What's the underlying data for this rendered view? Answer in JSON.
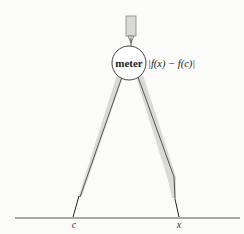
{
  "diagram": {
    "title": "",
    "meter": {
      "label": "meter",
      "reading": "|f(x) − f(c)|"
    },
    "axis": {
      "points": [
        {
          "label": "c"
        },
        {
          "label": "x"
        }
      ]
    },
    "colors": {
      "background": "#fbfbf9",
      "leg_fill": "#d9d9d6",
      "stroke": "#333333"
    }
  }
}
